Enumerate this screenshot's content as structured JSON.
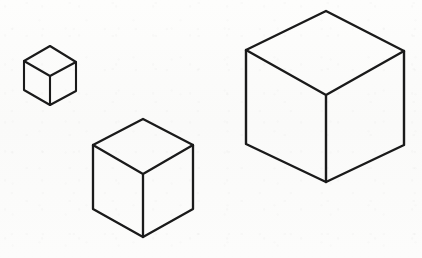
{
  "figure": {
    "background_color": "#fbfbfa",
    "line_color": "#1a1a1a",
    "fill_color": "none",
    "canvas": {
      "width": 422,
      "height": 258
    },
    "object_count": "3"
  },
  "cubes": [
    {
      "id": "cube-small",
      "label": "Small cube",
      "size_rank": "1",
      "stroke_width": "2.1",
      "vertices": {
        "top_apex": {
          "x": 50,
          "y": 46
        },
        "top_left": {
          "x": 24,
          "y": 61
        },
        "top_right": {
          "x": 76,
          "y": 62
        },
        "center": {
          "x": 50,
          "y": 76
        },
        "bottom_left": {
          "x": 24,
          "y": 90
        },
        "bottom_right": {
          "x": 76,
          "y": 91
        },
        "bottom_apex": {
          "x": 50,
          "y": 105
        }
      },
      "edge_length": "30",
      "width_px": "52",
      "height_px": "59"
    },
    {
      "id": "cube-medium",
      "label": "Medium cube",
      "size_rank": "2",
      "stroke_width": "2.3",
      "vertices": {
        "top_apex": {
          "x": 143,
          "y": 119
        },
        "top_left": {
          "x": 93,
          "y": 145
        },
        "top_right": {
          "x": 193,
          "y": 145
        },
        "center": {
          "x": 143,
          "y": 174
        },
        "bottom_left": {
          "x": 93,
          "y": 209
        },
        "bottom_right": {
          "x": 193,
          "y": 209
        },
        "bottom_apex": {
          "x": 143,
          "y": 237
        }
      },
      "edge_length": "57",
      "width_px": "100",
      "height_px": "118"
    },
    {
      "id": "cube-large",
      "label": "Large cube",
      "size_rank": "3",
      "stroke_width": "2.4",
      "vertices": {
        "top_apex": {
          "x": 326,
          "y": 11
        },
        "top_left": {
          "x": 246,
          "y": 50
        },
        "top_right": {
          "x": 404,
          "y": 51
        },
        "center": {
          "x": 326,
          "y": 95
        },
        "bottom_left": {
          "x": 246,
          "y": 144
        },
        "bottom_right": {
          "x": 404,
          "y": 145
        },
        "bottom_apex": {
          "x": 326,
          "y": 182
        }
      },
      "edge_length": "89",
      "width_px": "158",
      "height_px": "171"
    }
  ]
}
